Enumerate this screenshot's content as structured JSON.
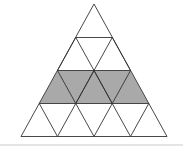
{
  "diagram": {
    "rows": 4,
    "small_triangles": 16,
    "shaded_row": 3,
    "shaded_triangles": 5,
    "colors": {
      "line": "#333333",
      "shade": "#a9a9a9",
      "background": "#ffffff"
    }
  }
}
